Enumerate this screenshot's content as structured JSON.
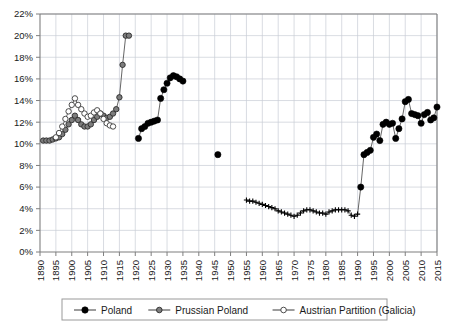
{
  "chart_data": {
    "type": "line",
    "title": "",
    "subtitle": "",
    "xlabel": "",
    "ylabel": "",
    "xlim": [
      1890,
      2015
    ],
    "ylim": [
      0,
      22
    ],
    "ytick_step": 2,
    "xtick_step": 5,
    "ytick_labels": [
      "0%",
      "2%",
      "4%",
      "6%",
      "8%",
      "10%",
      "12%",
      "14%",
      "16%",
      "18%",
      "20%",
      "22%"
    ],
    "ytick_values": [
      0,
      2,
      4,
      6,
      8,
      10,
      12,
      14,
      16,
      18,
      20,
      22
    ],
    "xtick_labels": [
      "1890",
      "1895",
      "1900",
      "1905",
      "1910",
      "1915",
      "1920",
      "1925",
      "1930",
      "1935",
      "1940",
      "1945",
      "1950",
      "1955",
      "1960",
      "1965",
      "1970",
      "1975",
      "1980",
      "1985",
      "1990",
      "1995",
      "2000",
      "2005",
      "2010",
      "2015"
    ],
    "xtick_values": [
      1890,
      1895,
      1900,
      1905,
      1910,
      1915,
      1920,
      1925,
      1930,
      1935,
      1940,
      1945,
      1950,
      1955,
      1960,
      1965,
      1970,
      1975,
      1980,
      1985,
      1990,
      1995,
      2000,
      2005,
      2010,
      2015
    ],
    "grid": true,
    "grid_color": "#c9cdd6",
    "legend_position": "bottom",
    "value_unit": "percent",
    "series": [
      {
        "name": "Poland",
        "color": "#000000",
        "marker": "filled-circle",
        "points": [
          [
            1921,
            10.5
          ],
          [
            1922,
            11.4
          ],
          [
            1923,
            11.6
          ],
          [
            1924,
            11.9
          ],
          [
            1925,
            12.0
          ],
          [
            1926,
            12.1
          ],
          [
            1927,
            12.2
          ],
          [
            1928,
            14.2
          ],
          [
            1929,
            15.0
          ],
          [
            1930,
            15.6
          ],
          [
            1931,
            16.1
          ],
          [
            1932,
            16.3
          ],
          [
            1933,
            16.2
          ],
          [
            1934,
            16.0
          ],
          [
            1935,
            15.8
          ],
          [
            1946,
            9.0
          ],
          [
            1955,
            4.8
          ],
          [
            1956,
            4.7
          ],
          [
            1957,
            4.7
          ],
          [
            1958,
            4.6
          ],
          [
            1959,
            4.5
          ],
          [
            1960,
            4.4
          ],
          [
            1961,
            4.3
          ],
          [
            1962,
            4.2
          ],
          [
            1963,
            4.1
          ],
          [
            1964,
            4.0
          ],
          [
            1965,
            3.8
          ],
          [
            1966,
            3.7
          ],
          [
            1967,
            3.6
          ],
          [
            1968,
            3.5
          ],
          [
            1969,
            3.4
          ],
          [
            1970,
            3.3
          ],
          [
            1971,
            3.4
          ],
          [
            1972,
            3.6
          ],
          [
            1973,
            3.8
          ],
          [
            1974,
            3.9
          ],
          [
            1975,
            3.9
          ],
          [
            1976,
            3.8
          ],
          [
            1977,
            3.7
          ],
          [
            1978,
            3.6
          ],
          [
            1979,
            3.6
          ],
          [
            1980,
            3.5
          ],
          [
            1981,
            3.7
          ],
          [
            1982,
            3.8
          ],
          [
            1983,
            3.9
          ],
          [
            1984,
            3.9
          ],
          [
            1985,
            3.9
          ],
          [
            1986,
            3.9
          ],
          [
            1987,
            3.8
          ],
          [
            1988,
            3.4
          ],
          [
            1989,
            3.3
          ],
          [
            1990,
            3.5
          ],
          [
            1991,
            6.0
          ],
          [
            1992,
            9.0
          ],
          [
            1993,
            9.2
          ],
          [
            1994,
            9.4
          ],
          [
            1995,
            10.6
          ],
          [
            1996,
            10.9
          ],
          [
            1997,
            10.3
          ],
          [
            1998,
            11.8
          ],
          [
            1999,
            12.0
          ],
          [
            2000,
            11.8
          ],
          [
            2001,
            11.9
          ],
          [
            2002,
            10.5
          ],
          [
            2003,
            11.4
          ],
          [
            2004,
            12.3
          ],
          [
            2005,
            13.9
          ],
          [
            2006,
            14.1
          ],
          [
            2007,
            12.8
          ],
          [
            2008,
            12.7
          ],
          [
            2009,
            12.6
          ],
          [
            2010,
            11.9
          ],
          [
            2011,
            12.7
          ],
          [
            2012,
            12.9
          ],
          [
            2013,
            12.2
          ],
          [
            2014,
            12.4
          ],
          [
            2015,
            13.4
          ]
        ]
      },
      {
        "name": "Prussian Poland",
        "color": "#666666",
        "marker": "gray-circle",
        "points": [
          [
            1891,
            10.3
          ],
          [
            1892,
            10.3
          ],
          [
            1893,
            10.3
          ],
          [
            1894,
            10.4
          ],
          [
            1895,
            10.5
          ],
          [
            1896,
            10.6
          ],
          [
            1897,
            10.9
          ],
          [
            1898,
            11.3
          ],
          [
            1899,
            11.8
          ],
          [
            1900,
            12.2
          ],
          [
            1901,
            12.6
          ],
          [
            1902,
            12.2
          ],
          [
            1903,
            11.8
          ],
          [
            1904,
            11.6
          ],
          [
            1905,
            11.6
          ],
          [
            1906,
            11.8
          ],
          [
            1907,
            12.2
          ],
          [
            1908,
            12.5
          ],
          [
            1909,
            12.8
          ],
          [
            1910,
            12.6
          ],
          [
            1911,
            12.4
          ],
          [
            1912,
            12.5
          ],
          [
            1913,
            12.8
          ],
          [
            1914,
            13.2
          ],
          [
            1915,
            14.3
          ],
          [
            1916,
            17.3
          ],
          [
            1917,
            20.0
          ],
          [
            1918,
            20.0
          ]
        ]
      },
      {
        "name": "Austrian Partition (Galicia)",
        "color": "#888888",
        "marker": "open-circle",
        "points": [
          [
            1895,
            10.6
          ],
          [
            1896,
            11.0
          ],
          [
            1897,
            11.6
          ],
          [
            1898,
            12.3
          ],
          [
            1899,
            13.0
          ],
          [
            1900,
            13.6
          ],
          [
            1901,
            14.2
          ],
          [
            1902,
            13.6
          ],
          [
            1903,
            13.2
          ],
          [
            1904,
            12.8
          ],
          [
            1905,
            12.5
          ],
          [
            1906,
            12.6
          ],
          [
            1907,
            12.9
          ],
          [
            1908,
            13.1
          ],
          [
            1909,
            12.8
          ],
          [
            1910,
            12.3
          ],
          [
            1911,
            11.9
          ],
          [
            1912,
            11.7
          ],
          [
            1913,
            11.6
          ]
        ]
      }
    ]
  },
  "legend": {
    "items": [
      {
        "label": "Poland",
        "marker": "filled-circle",
        "color": "#000000"
      },
      {
        "label": "Prussian Poland",
        "marker": "gray-circle",
        "color": "#666666"
      },
      {
        "label": "Austrian Partition (Galicia)",
        "marker": "open-circle",
        "color": "#888888"
      }
    ]
  }
}
